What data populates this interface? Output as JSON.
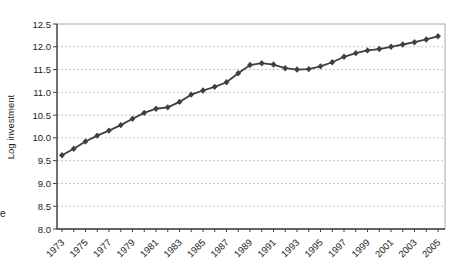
{
  "figure": {
    "left_margin_fragment": "e"
  },
  "chart_data": {
    "type": "line",
    "title": "",
    "xlabel": "",
    "ylabel": "Log investment",
    "legend": "none",
    "grid": "horizontal-dashed",
    "marker": "diamond",
    "ylim": [
      8.0,
      12.5
    ],
    "ytick_step": 0.5,
    "y_tick_labels": [
      "8.0",
      "8.5",
      "9.0",
      "9.5",
      "10.0",
      "10.5",
      "11.0",
      "11.5",
      "12.0",
      "12.5"
    ],
    "x": [
      1973,
      1974,
      1975,
      1976,
      1977,
      1978,
      1979,
      1980,
      1981,
      1982,
      1983,
      1984,
      1985,
      1986,
      1987,
      1988,
      1989,
      1990,
      1991,
      1992,
      1993,
      1994,
      1995,
      1996,
      1997,
      1998,
      1999,
      2000,
      2001,
      2002,
      2003,
      2004,
      2005
    ],
    "x_tick_labels": [
      "1973",
      "1975",
      "1977",
      "1979",
      "1981",
      "1983",
      "1985",
      "1987",
      "1989",
      "1991",
      "1993",
      "1995",
      "1997",
      "1999",
      "2001",
      "2003",
      "2005"
    ],
    "values": [
      9.62,
      9.76,
      9.92,
      10.05,
      10.16,
      10.28,
      10.42,
      10.55,
      10.64,
      10.67,
      10.79,
      10.95,
      11.04,
      11.12,
      11.22,
      11.42,
      11.6,
      11.64,
      11.61,
      11.53,
      11.5,
      11.51,
      11.57,
      11.66,
      11.78,
      11.86,
      11.92,
      11.95,
      12.0,
      12.05,
      12.1,
      12.16,
      12.23
    ],
    "line_color": "#3f3f3f",
    "axis_color": "#3f3f3f",
    "gridline_color": "#c6c6c6",
    "frame_color": "#a6a6a6",
    "text_color": "#1a1a1a"
  }
}
